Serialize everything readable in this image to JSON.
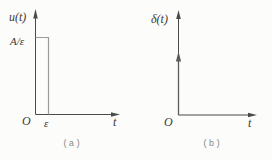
{
  "panel_a": {
    "y_axis_label": "u(t)",
    "amplitude_label": "A/ε",
    "origin_label": "O",
    "pulse_width_label": "ε",
    "x_axis_label": "t",
    "caption": "(a)"
  },
  "panel_b": {
    "y_axis_label": "δ(t)",
    "origin_label": "O",
    "x_axis_label": "t",
    "caption": "(b)"
  },
  "colors": {
    "background": "#fcfcfa",
    "axis": "#4a4a4a",
    "pulse": "#9a9a9a",
    "impulse": "#5a5a5a",
    "label": "#3a3a3a",
    "caption": "#8a8a8a"
  }
}
